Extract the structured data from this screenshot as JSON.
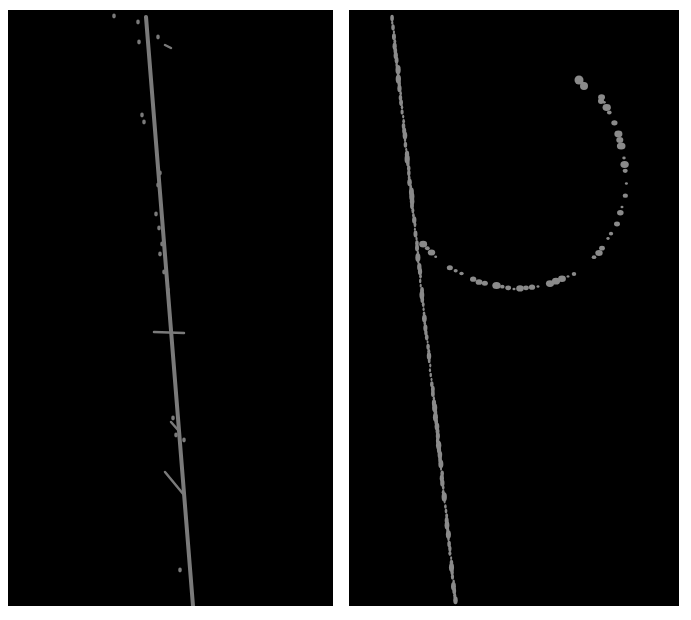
{
  "figure": {
    "background": "#ffffff",
    "panels": [
      {
        "id": "left",
        "x": 8,
        "y": 10,
        "width": 325,
        "height": 596,
        "background": "#000000",
        "filament_color": "#7a7a7a",
        "filament": {
          "x1": 138,
          "y1": 7,
          "x2": 185,
          "y2": 596,
          "width": 4
        },
        "branches": [
          {
            "x1": 146,
            "y1": 322,
            "x2": 176,
            "y2": 323
          },
          {
            "x1": 157,
            "y1": 462,
            "x2": 176,
            "y2": 485
          },
          {
            "x1": 157,
            "y1": 35,
            "x2": 163,
            "y2": 38
          },
          {
            "x1": 163,
            "y1": 412,
            "x2": 170,
            "y2": 420
          }
        ],
        "specks": [
          [
            106,
            6
          ],
          [
            130,
            12
          ],
          [
            131,
            32
          ],
          [
            150,
            27
          ],
          [
            134,
            105
          ],
          [
            136,
            112
          ],
          [
            152,
            163
          ],
          [
            150,
            175
          ],
          [
            148,
            204
          ],
          [
            151,
            218
          ],
          [
            154,
            234
          ],
          [
            152,
            244
          ],
          [
            156,
            262
          ],
          [
            160,
            280
          ],
          [
            165,
            408
          ],
          [
            168,
            425
          ],
          [
            176,
            430
          ],
          [
            172,
            560
          ]
        ]
      },
      {
        "id": "right",
        "x": 349,
        "y": 10,
        "width": 330,
        "height": 596,
        "background": "#000000",
        "filament_color": "#8a8a8a",
        "dotted_line": {
          "x1": 43,
          "y1": 8,
          "x2": 107,
          "y2": 595
        },
        "curve_points": [
          [
            70,
            230
          ],
          [
            95,
            255
          ],
          [
            130,
            272
          ],
          [
            165,
            279
          ],
          [
            195,
            276
          ],
          [
            225,
            264
          ],
          [
            250,
            243
          ],
          [
            268,
            214
          ],
          [
            278,
            180
          ],
          [
            275,
            148
          ],
          [
            268,
            118
          ],
          [
            250,
            82
          ],
          [
            229,
            70
          ]
        ]
      }
    ]
  }
}
